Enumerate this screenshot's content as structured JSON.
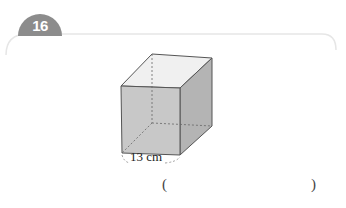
{
  "question": {
    "number": "16",
    "figure": {
      "shape": "cube",
      "edge_label": "13 cm"
    },
    "answer_blank": {
      "open": "(",
      "close": ")",
      "value": ""
    }
  },
  "colors": {
    "badge": "#8c8c8c",
    "frame_line": "#e6e6e6",
    "front_face": "#c8c8c8",
    "side_face": "#b4b4b4",
    "top_face": "#f0f0f0"
  }
}
